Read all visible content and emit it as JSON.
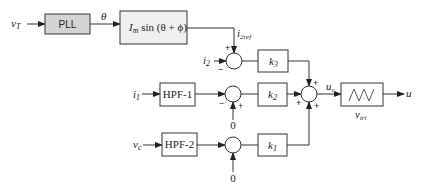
{
  "diagram": {
    "type": "control-block-diagram",
    "inputs": {
      "vT": "v",
      "vT_sub": "T",
      "i2": "i",
      "i2_sub": "2",
      "i1": "i",
      "i1_sub": "1",
      "vc": "v",
      "vc_sub": "c",
      "zero_top": "0",
      "zero_bottom": "0"
    },
    "blocks": {
      "pll": "PLL",
      "sine_pre": "I",
      "sine_sub": "m",
      "sine_post": " sin (θ + ϕ)",
      "hpf1": "HPF-1",
      "hpf2": "HPF-2",
      "k3": "k",
      "k3_sub": "3",
      "k2": "k",
      "k2_sub": "2",
      "k1": "k",
      "k1_sub": "1"
    },
    "signals": {
      "theta": "θ",
      "i2ref": "i",
      "i2ref_sub": "2ref",
      "uc": "u",
      "uc_sub": "c",
      "vtri": "v",
      "vtri_sub": "tri",
      "u_out": "u"
    },
    "signs": {
      "plus": "+",
      "minus": "−"
    }
  }
}
